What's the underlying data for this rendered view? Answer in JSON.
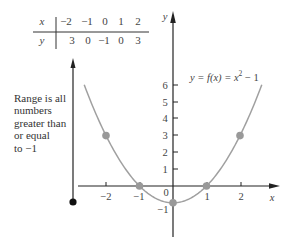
{
  "table": {
    "row_x_label": "x",
    "row_y_label": "y",
    "x_values": [
      "−2",
      "−1",
      "0",
      "1",
      "2"
    ],
    "y_values": [
      "3",
      "0",
      "−1",
      "0",
      "3"
    ]
  },
  "range_note": {
    "lines": [
      "Range is all",
      "numbers",
      "greater than",
      "or equal",
      "to −1"
    ]
  },
  "graph": {
    "x_axis_label": "x",
    "y_axis_label": "y",
    "function_label": "y = f(x) = x",
    "function_label_exp": "2",
    "function_label_tail": " − 1",
    "x_tick_labels": [
      "−2",
      "−1",
      "0",
      "1",
      "2"
    ],
    "y_tick_labels": [
      "1",
      "2",
      "3",
      "4",
      "5",
      "6",
      "−1"
    ],
    "colors": {
      "curve": "#a0a0a0",
      "points": "#999999",
      "axes": "#222222",
      "range_dot": "#111111"
    }
  },
  "chart_data": {
    "type": "line",
    "xlabel": "x",
    "ylabel": "y",
    "function": "x^2 - 1",
    "table": {
      "x": [
        -2,
        -1,
        0,
        1,
        2
      ],
      "y": [
        3,
        0,
        -1,
        0,
        3
      ]
    },
    "series": [
      {
        "name": "f(x) = x^2 - 1",
        "x": [
          -2,
          -1,
          0,
          1,
          2
        ],
        "y": [
          3,
          0,
          -1,
          0,
          3
        ]
      }
    ],
    "x_ticks": [
      -2,
      -1,
      0,
      1,
      2
    ],
    "y_ticks": [
      -1,
      1,
      2,
      3,
      4,
      5,
      6
    ],
    "xlim": [
      -2.8,
      3
    ],
    "ylim": [
      -3,
      10
    ],
    "annotations": [
      "Range is all numbers greater than or equal to −1"
    ],
    "grid": false,
    "legend": "none"
  }
}
